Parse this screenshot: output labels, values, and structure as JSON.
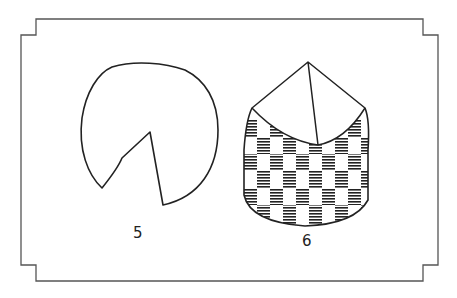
{
  "figures": [
    {
      "id": "5",
      "label": "5",
      "description": "pie shape with a wedge removed"
    },
    {
      "id": "6",
      "label": "6",
      "description": "checkered cylinder with cone-like top"
    }
  ],
  "colors": {
    "stroke": "#222222",
    "frame": "#555555",
    "background": "#ffffff"
  }
}
